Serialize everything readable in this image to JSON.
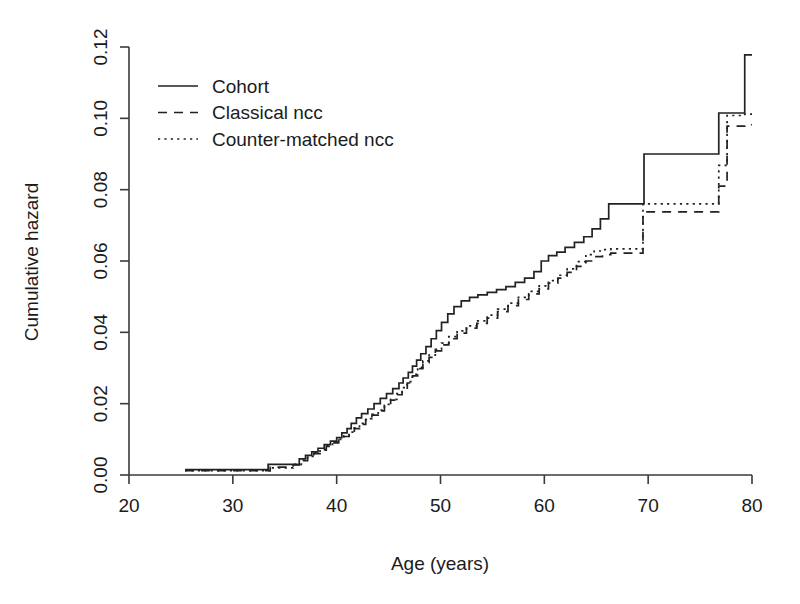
{
  "chart_data": {
    "type": "line",
    "title": "",
    "xlabel": "Age (years)",
    "ylabel": "Cumulative hazard",
    "xlim": [
      20,
      80
    ],
    "ylim": [
      0.0,
      0.12
    ],
    "xticks": [
      20,
      30,
      40,
      50,
      60,
      70,
      80
    ],
    "yticks": [
      0.0,
      0.02,
      0.04,
      0.06,
      0.08,
      0.1,
      0.12
    ],
    "xticklabels": [
      "20",
      "30",
      "40",
      "50",
      "60",
      "70",
      "80"
    ],
    "yticklabels": [
      "0.00",
      "0.02",
      "0.04",
      "0.06",
      "0.08",
      "0.10",
      "0.12"
    ],
    "grid": false,
    "legend_position": "upper left",
    "step_type": "post",
    "series": [
      {
        "name": "Cohort",
        "style": "solid",
        "color": "#222222",
        "x": [
          25.4,
          27.3,
          32.8,
          33.4,
          34.2,
          35.6,
          36.4,
          37.0,
          37.6,
          38.2,
          38.8,
          39.4,
          40.0,
          40.5,
          41.0,
          41.4,
          41.9,
          42.4,
          43.0,
          43.6,
          44.2,
          44.8,
          45.4,
          46.0,
          46.4,
          46.9,
          47.3,
          47.7,
          48.1,
          48.6,
          49.1,
          49.6,
          50.1,
          50.7,
          51.3,
          52.0,
          52.8,
          53.6,
          54.5,
          55.4,
          56.3,
          57.2,
          58.1,
          59.0,
          59.7,
          60.4,
          61.2,
          62.0,
          62.9,
          63.8,
          64.6,
          65.4,
          66.2,
          69.6,
          76.8,
          79.3,
          80.0
        ],
        "y": [
          0.0015,
          0.0015,
          0.0015,
          0.003,
          0.003,
          0.003,
          0.0045,
          0.0055,
          0.0065,
          0.0075,
          0.0085,
          0.0095,
          0.0105,
          0.0118,
          0.013,
          0.0145,
          0.016,
          0.0172,
          0.0185,
          0.02,
          0.0215,
          0.0228,
          0.0242,
          0.0258,
          0.0272,
          0.0288,
          0.0305,
          0.0322,
          0.034,
          0.036,
          0.0382,
          0.0405,
          0.0428,
          0.0452,
          0.0472,
          0.0488,
          0.0498,
          0.0505,
          0.0512,
          0.052,
          0.0528,
          0.054,
          0.0552,
          0.057,
          0.06,
          0.0615,
          0.0625,
          0.0638,
          0.0652,
          0.0668,
          0.069,
          0.0718,
          0.076,
          0.09,
          0.1015,
          0.1178,
          0.1178
        ]
      },
      {
        "name": "Classical ncc",
        "style": "dashed",
        "color": "#222222",
        "x": [
          25.4,
          27.3,
          32.8,
          33.6,
          34.6,
          35.8,
          36.6,
          37.2,
          37.8,
          38.4,
          39.0,
          39.6,
          40.2,
          40.7,
          41.2,
          41.7,
          42.2,
          42.8,
          43.4,
          44.0,
          44.6,
          45.2,
          45.8,
          46.3,
          46.8,
          47.3,
          47.8,
          48.3,
          48.9,
          49.5,
          50.1,
          50.8,
          51.6,
          52.5,
          53.5,
          54.5,
          55.5,
          56.5,
          57.5,
          58.5,
          59.5,
          60.4,
          61.3,
          62.2,
          63.1,
          64.0,
          64.8,
          65.6,
          66.4,
          69.5,
          76.8,
          77.6,
          79.3,
          80.0
        ],
        "y": [
          0.0012,
          0.0012,
          0.0012,
          0.0022,
          0.0022,
          0.0028,
          0.004,
          0.005,
          0.006,
          0.007,
          0.008,
          0.009,
          0.0098,
          0.0108,
          0.0118,
          0.013,
          0.0142,
          0.0155,
          0.0168,
          0.018,
          0.0195,
          0.021,
          0.0225,
          0.024,
          0.0258,
          0.0278,
          0.0298,
          0.0315,
          0.033,
          0.0348,
          0.0365,
          0.0382,
          0.0398,
          0.0412,
          0.0425,
          0.044,
          0.0458,
          0.0475,
          0.0492,
          0.0508,
          0.0522,
          0.0538,
          0.0552,
          0.0568,
          0.0585,
          0.06,
          0.0612,
          0.0618,
          0.0622,
          0.0738,
          0.081,
          0.0978,
          0.0982,
          0.0982
        ]
      },
      {
        "name": "Counter-matched ncc",
        "style": "dotted",
        "color": "#222222",
        "x": [
          25.4,
          27.3,
          32.8,
          33.6,
          34.6,
          35.8,
          36.6,
          37.2,
          37.8,
          38.4,
          39.0,
          39.6,
          40.2,
          40.7,
          41.2,
          41.7,
          42.2,
          42.8,
          43.4,
          44.0,
          44.6,
          45.2,
          45.8,
          46.3,
          46.8,
          47.3,
          47.8,
          48.3,
          48.9,
          49.5,
          50.1,
          50.8,
          51.6,
          52.5,
          53.5,
          54.5,
          55.5,
          56.5,
          57.5,
          58.5,
          59.5,
          60.4,
          61.3,
          62.2,
          63.1,
          64.0,
          64.8,
          65.6,
          66.4,
          69.5,
          76.8,
          77.6,
          79.3,
          80.0
        ],
        "y": [
          0.0012,
          0.0012,
          0.0012,
          0.002,
          0.002,
          0.003,
          0.0042,
          0.0052,
          0.0062,
          0.0072,
          0.0082,
          0.0092,
          0.01,
          0.011,
          0.012,
          0.0132,
          0.0145,
          0.0158,
          0.017,
          0.0182,
          0.0198,
          0.0212,
          0.0228,
          0.0245,
          0.0262,
          0.0282,
          0.0302,
          0.032,
          0.0336,
          0.0352,
          0.037,
          0.0388,
          0.0404,
          0.0418,
          0.0432,
          0.0448,
          0.0465,
          0.0482,
          0.0498,
          0.0515,
          0.053,
          0.0545,
          0.056,
          0.0578,
          0.0598,
          0.0618,
          0.0628,
          0.0632,
          0.0634,
          0.076,
          0.0868,
          0.1008,
          0.1012,
          0.1012
        ]
      }
    ]
  },
  "legend": {
    "entries": [
      {
        "label": "Cohort",
        "style": "solid"
      },
      {
        "label": "Classical ncc",
        "style": "dashed"
      },
      {
        "label": "Counter-matched ncc",
        "style": "dotted"
      }
    ]
  }
}
